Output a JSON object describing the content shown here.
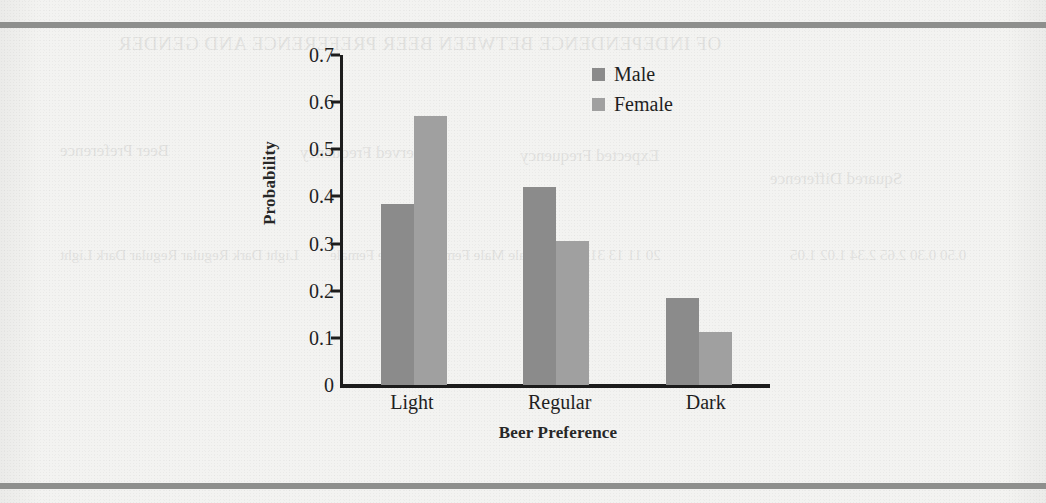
{
  "page": {
    "rules": [
      "top-rule",
      "bottom-rule"
    ],
    "bleed_through": {
      "title": "OF INDEPENDENCE BETWEEN BEER PREFERENCE AND GENDER",
      "col_a": "Beer\nPreference",
      "col_b": "Observed\nFrequency",
      "col_c": "Expected\nFrequency",
      "col_d": "Squared\nDifference",
      "rows_a": "Light\nDark\nRegular\nRegular\nDark\nLight",
      "rows_b": "Male\nMale\nMale\nFemale\nFemale\nFemale",
      "rows_c": "20\n11\n13\n31\n6\n13",
      "rows_d": "0.50\n0.30\n2.65\n2.34\n1.02\n1.05"
    }
  },
  "chart_data": {
    "type": "bar",
    "title": "",
    "xlabel": "Beer Preference",
    "ylabel": "Probability",
    "categories": [
      "Light",
      "Regular",
      "Dark"
    ],
    "series": [
      {
        "name": "Male",
        "color": "#8b8b8b",
        "values": [
          0.385,
          0.42,
          0.185
        ]
      },
      {
        "name": "Female",
        "color": "#a0a0a0",
        "values": [
          0.57,
          0.305,
          0.113
        ]
      }
    ],
    "ylim": [
      0,
      0.7
    ],
    "ytick_values": [
      0.7,
      0.6,
      0.5,
      0.4,
      0.3,
      0.2,
      0.1,
      0
    ],
    "ytick_labels": [
      "0.7",
      "0.6",
      "0.5",
      "0.4",
      "0.3",
      "0.2",
      "0.1",
      "0"
    ],
    "grid": false,
    "legend_position": "top-right"
  }
}
